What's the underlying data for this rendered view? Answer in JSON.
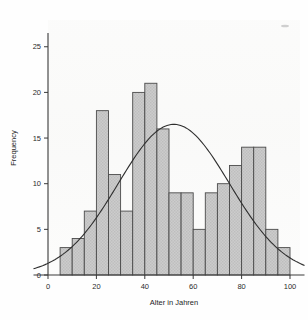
{
  "chart_data": {
    "type": "bar",
    "title": "",
    "subtitle": "",
    "xlabel": "Alter in Jahren",
    "ylabel": "Frequency",
    "xlim": [
      -6,
      106
    ],
    "ylim": [
      0,
      26.5
    ],
    "xticks": [
      0,
      20,
      40,
      60,
      80,
      100
    ],
    "yticks": [
      0,
      5,
      10,
      15,
      20,
      25
    ],
    "xtick_labels": [
      "0",
      "20",
      "40",
      "60",
      "80",
      "100"
    ],
    "ytick_labels": [
      "0",
      "5",
      "10",
      "15",
      "20",
      "25"
    ],
    "grid": false,
    "legend": false,
    "bin_width": 5,
    "bin_start": 5,
    "categories": [
      "5-10",
      "10-15",
      "15-20",
      "20-25",
      "25-30",
      "30-35",
      "35-40",
      "40-45",
      "45-50",
      "50-55",
      "55-60",
      "60-65",
      "65-70",
      "70-75",
      "75-80",
      "80-85",
      "85-90",
      "90-95",
      "95-100"
    ],
    "bin_edges": [
      5,
      10,
      15,
      20,
      25,
      30,
      35,
      40,
      45,
      50,
      55,
      60,
      65,
      70,
      75,
      80,
      85,
      90,
      95,
      100
    ],
    "values": [
      3,
      4,
      7,
      18,
      11,
      7,
      20,
      21,
      16,
      9,
      9,
      5,
      9,
      10,
      12,
      14,
      14,
      5,
      3
    ],
    "series": [
      {
        "name": "Frequency",
        "values": [
          3,
          4,
          7,
          18,
          11,
          7,
          20,
          21,
          16,
          9,
          9,
          5,
          9,
          10,
          12,
          14,
          14,
          5,
          3
        ]
      }
    ],
    "overlay_curve": {
      "name": "normal-distribution-fit",
      "type": "line",
      "peak_y": 16.5,
      "peak_x": 52,
      "mean": 52,
      "std_dev": 23,
      "amplitude": 16.5,
      "endpoint_left_y": 1.0,
      "endpoint_right_y": 1.2
    },
    "colors": {
      "bar_fill": "#c9c9c9",
      "bar_edge": "#4a4a4a",
      "curve": "#2e2e2e",
      "axis": "#3a3a3a",
      "background": "#fefefe"
    }
  }
}
